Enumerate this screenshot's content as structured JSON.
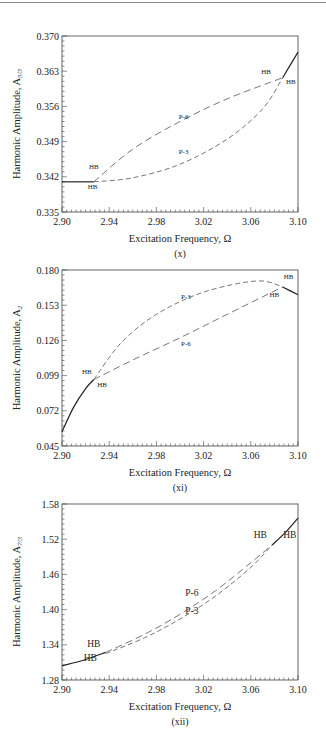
{
  "chart_data": [
    {
      "type": "line",
      "panel_label": "(x)",
      "xlabel": "Excitation Frequency, Ω",
      "ylabel": "Harmonic Amplitude, A",
      "ylabel_subscript": "5/3",
      "xlim": [
        2.9,
        3.1
      ],
      "ylim": [
        0.335,
        0.37
      ],
      "xticks": [
        "2.90",
        "2.94",
        "2.98",
        "3.02",
        "3.06",
        "3.10"
      ],
      "yticks": [
        "0.335",
        "0.342",
        "0.349",
        "0.356",
        "0.363",
        "0.370"
      ],
      "grid": false,
      "series": [
        {
          "name": "stable (solid, left)",
          "style": "solid",
          "x": [
            2.9,
            2.927
          ],
          "y": [
            0.341,
            0.341
          ]
        },
        {
          "name": "P-6",
          "style": "long-dash",
          "x": [
            2.927,
            2.96,
            3.0,
            3.04,
            3.087
          ],
          "y": [
            0.341,
            0.3475,
            0.353,
            0.3575,
            0.3617
          ]
        },
        {
          "name": "P-3",
          "style": "dash",
          "x": [
            2.927,
            2.96,
            3.0,
            3.04,
            3.07,
            3.087
          ],
          "y": [
            0.341,
            0.3418,
            0.3445,
            0.3495,
            0.3555,
            0.3617
          ]
        },
        {
          "name": "stable (solid, right)",
          "style": "solid",
          "x": [
            3.087,
            3.1
          ],
          "y": [
            0.3617,
            0.3668
          ]
        }
      ],
      "annotations": [
        {
          "text": "HB",
          "x": 2.927,
          "y": 0.3435
        },
        {
          "text": "HB",
          "x": 2.926,
          "y": 0.3395
        },
        {
          "text": "P-6",
          "x": 3.003,
          "y": 0.3535
        },
        {
          "text": "P-3",
          "x": 3.003,
          "y": 0.3465
        },
        {
          "text": "HB",
          "x": 3.073,
          "y": 0.3625
        },
        {
          "text": "HB",
          "x": 3.094,
          "y": 0.3605
        }
      ]
    },
    {
      "type": "line",
      "panel_label": "(xi)",
      "xlabel": "Excitation Frequency, Ω",
      "ylabel": "Harmonic Amplitude, A",
      "ylabel_subscript": "2",
      "xlim": [
        2.9,
        3.1
      ],
      "ylim": [
        0.045,
        0.18
      ],
      "xticks": [
        "2.90",
        "2.94",
        "2.98",
        "3.02",
        "3.06",
        "3.10"
      ],
      "yticks": [
        "0.045",
        "0.072",
        "0.099",
        "0.126",
        "0.153",
        "0.180"
      ],
      "grid": false,
      "series": [
        {
          "name": "stable (solid, left)",
          "style": "solid",
          "x": [
            2.9,
            2.91,
            2.92,
            2.927
          ],
          "y": [
            0.056,
            0.075,
            0.089,
            0.096
          ]
        },
        {
          "name": "P-3",
          "style": "dash",
          "x": [
            2.927,
            2.95,
            2.98,
            3.02,
            3.065,
            3.087
          ],
          "y": [
            0.096,
            0.124,
            0.146,
            0.163,
            0.1716,
            0.167
          ]
        },
        {
          "name": "P-6",
          "style": "long-dash",
          "x": [
            2.927,
            2.96,
            3.0,
            3.04,
            3.087
          ],
          "y": [
            0.096,
            0.111,
            0.128,
            0.146,
            0.167
          ]
        },
        {
          "name": "stable (solid, right)",
          "style": "solid",
          "x": [
            3.087,
            3.1
          ],
          "y": [
            0.167,
            0.161
          ]
        }
      ],
      "annotations": [
        {
          "text": "HB",
          "x": 2.921,
          "y": 0.1
        },
        {
          "text": "HB",
          "x": 2.934,
          "y": 0.09
        },
        {
          "text": "P-3",
          "x": 3.005,
          "y": 0.158
        },
        {
          "text": "P-6",
          "x": 3.005,
          "y": 0.122
        },
        {
          "text": "HB",
          "x": 3.092,
          "y": 0.173
        },
        {
          "text": "HB",
          "x": 3.08,
          "y": 0.159
        }
      ]
    },
    {
      "type": "line",
      "panel_label": "(xii)",
      "xlabel": "Excitation Frequency, Ω",
      "ylabel": "Harmonic Amplitude, A",
      "ylabel_subscript": "7/3",
      "xlim": [
        2.9,
        3.1
      ],
      "ylim": [
        1.28,
        1.58
      ],
      "xticks": [
        "2.90",
        "2.94",
        "2.98",
        "3.02",
        "3.06",
        "3.10"
      ],
      "yticks": [
        "1.28",
        "1.34",
        "1.40",
        "1.46",
        "1.52",
        "1.58"
      ],
      "grid": false,
      "series": [
        {
          "name": "stable (solid, left)",
          "style": "solid",
          "x": [
            2.9,
            2.92,
            2.937
          ],
          "y": [
            1.304,
            1.315,
            1.327
          ]
        },
        {
          "name": "P-6",
          "style": "long-dash",
          "x": [
            2.937,
            2.97,
            3.0,
            3.03,
            3.06,
            3.078
          ],
          "y": [
            1.327,
            1.358,
            1.392,
            1.432,
            1.48,
            1.51
          ]
        },
        {
          "name": "P-3",
          "style": "dash",
          "x": [
            2.937,
            2.97,
            3.0,
            3.03,
            3.06,
            3.078
          ],
          "y": [
            1.325,
            1.352,
            1.384,
            1.423,
            1.472,
            1.51
          ]
        },
        {
          "name": "stable (solid, right)",
          "style": "solid",
          "x": [
            3.078,
            3.09,
            3.1
          ],
          "y": [
            1.51,
            1.533,
            1.556
          ]
        }
      ],
      "annotations": [
        {
          "text": "HB",
          "x": 2.927,
          "y": 1.336
        },
        {
          "text": "HB",
          "x": 2.924,
          "y": 1.312
        },
        {
          "text": "P-6",
          "x": 3.01,
          "y": 1.424
        },
        {
          "text": "P-3",
          "x": 3.01,
          "y": 1.393
        },
        {
          "text": "HB",
          "x": 3.068,
          "y": 1.522
        },
        {
          "text": "HB",
          "x": 3.093,
          "y": 1.522
        }
      ]
    }
  ]
}
